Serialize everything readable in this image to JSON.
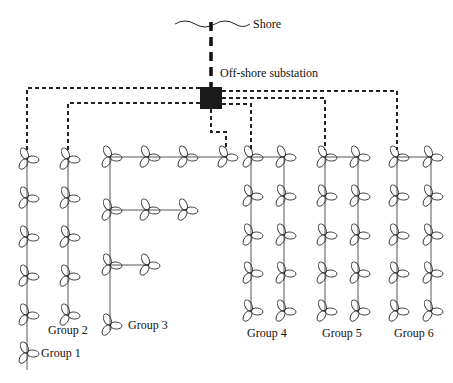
{
  "labels": {
    "shore": "Shore",
    "substation": "Off-shore substation",
    "groups": [
      "Group 1",
      "Group 2",
      "Group 3",
      "Group 4",
      "Group 5",
      "Group 6"
    ]
  },
  "colors": {
    "line": "#222222",
    "substation": "#1a1a1a"
  },
  "layout": {
    "turbine_counts": {
      "group1": 6,
      "group2": 5,
      "group3": 9,
      "group4": 10,
      "group5": 10,
      "group6": 10
    }
  }
}
